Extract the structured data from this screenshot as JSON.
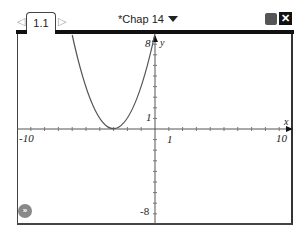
{
  "tabs": [
    {
      "label": "1.1",
      "active": true
    }
  ],
  "nav": {
    "prev_icon": "◁",
    "next_icon": "▷"
  },
  "document": {
    "title": "*Chap 14"
  },
  "toolbar": {
    "close_label": "✕"
  },
  "graph": {
    "x_min_label": "-10",
    "x_max_label": "10",
    "y_max_label": "8",
    "y_min_label": "-8",
    "x_unit_label": "1",
    "y_unit_label": "1",
    "x_axis_name": "x",
    "y_axis_name": "y",
    "function": "y = (x+3)^2",
    "curve_color": "#555555"
  },
  "play_button": {
    "label": "»"
  }
}
